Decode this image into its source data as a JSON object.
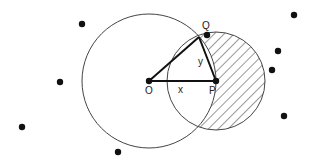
{
  "diagram": {
    "labels": {
      "O": "O",
      "P": "P",
      "Q": "Q",
      "x": "x",
      "y": "y"
    },
    "points": {
      "O": [
        149,
        81
      ],
      "P": [
        216,
        81
      ],
      "Q_dot": [
        207,
        35
      ],
      "Q_apex": [
        199,
        37
      ]
    },
    "circles": {
      "big": {
        "center": "O",
        "r": 67
      },
      "small": {
        "center": "P",
        "r": 49,
        "hatched_region": "small circle outside big circle"
      }
    },
    "scatter_dots": [
      [
        82,
        24
      ],
      [
        60,
        82
      ],
      [
        22,
        127
      ],
      [
        118,
        152
      ],
      [
        294,
        15
      ],
      [
        278,
        51
      ],
      [
        272,
        70
      ],
      [
        284,
        116
      ]
    ],
    "colors": {
      "stroke": "#333333",
      "dot": "#111111",
      "background": "#ffffff"
    }
  }
}
